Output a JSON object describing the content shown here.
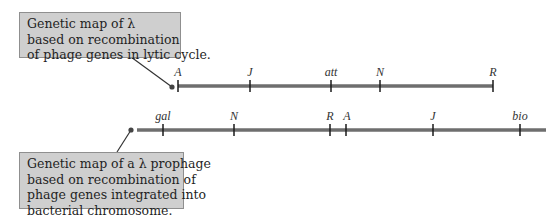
{
  "callouts": {
    "top": {
      "lines": [
        "Genetic map of λ",
        "based on recombination",
        "of phage genes in lytic cycle."
      ]
    },
    "bottom": {
      "lines": [
        "Genetic map of a λ prophage",
        "based on recombination of",
        "phage genes integrated into",
        "bacterial chromosome."
      ]
    }
  },
  "maps": {
    "lytic": {
      "genes": [
        "A",
        "J",
        "att",
        "N",
        "R"
      ]
    },
    "prophage": {
      "genes": [
        "gal",
        "N",
        "R",
        "A",
        "J",
        "bio"
      ]
    }
  },
  "colors": {
    "line": "#6e6e6e",
    "tick": "#1a1a1a",
    "callout_fill": "#cfcfcf",
    "callout_border": "#8f8f8f"
  }
}
